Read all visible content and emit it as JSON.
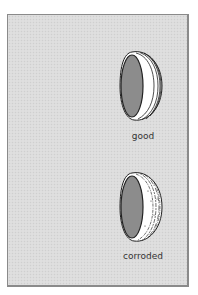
{
  "panel": {
    "background_color": "#dcdcdc",
    "border_color": "#8a8a8a"
  },
  "items": [
    {
      "label": "good",
      "condition": "smooth",
      "inner_face_color": "#8c8c8c",
      "outer_color": "#ffffff",
      "stroke_color": "#222222"
    },
    {
      "label": "corroded",
      "condition": "rough",
      "inner_face_color": "#8c8c8c",
      "outer_color": "#ffffff",
      "stroke_color": "#222222"
    }
  ]
}
